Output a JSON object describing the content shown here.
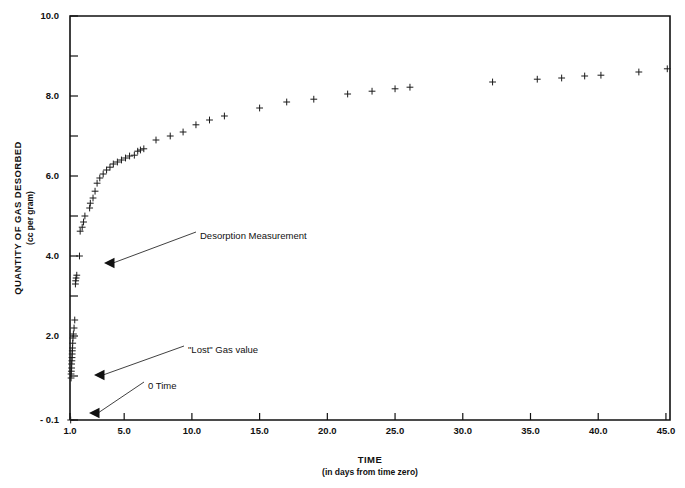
{
  "chart_data": {
    "type": "scatter",
    "title": "",
    "xlabel": "TIME",
    "xlabel_sub": "(in days from time zero)",
    "ylabel": "QUANTITY OF GAS DESORBED",
    "ylabel_sub": "(cc per gram)",
    "xlim": [
      1.0,
      45.3
    ],
    "ylim": [
      -0.1,
      10.0
    ],
    "grid": false,
    "legend": "none",
    "marker": "plus",
    "marker_color": "#1a1a1a",
    "xticks": [
      "1.0",
      "5.0",
      "10.0",
      "15.0",
      "20.0",
      "25.0",
      "30.0",
      "35.0",
      "40.0",
      "45.0"
    ],
    "xtick_values": [
      1.0,
      5.0,
      10.0,
      15.0,
      20.0,
      25.0,
      30.0,
      35.0,
      40.0,
      45.0
    ],
    "yticks": [
      "10.0",
      "8.0",
      "6.0",
      "4.0",
      "2.0",
      "- 0.1"
    ],
    "ytick_values": [
      10.0,
      8.0,
      6.0,
      4.0,
      2.0,
      -0.1
    ],
    "yminor_values": [
      9.0,
      7.0,
      5.0,
      3.0,
      1.0
    ],
    "series": [
      {
        "name": "Desorption data",
        "x": [
          1.05,
          1.08,
          1.08,
          1.1,
          1.12,
          1.12,
          1.14,
          1.15,
          1.16,
          1.17,
          1.18,
          1.2,
          1.22,
          1.25,
          1.3,
          1.35,
          1.4,
          1.42,
          1.45,
          1.5,
          1.7,
          1.75,
          1.9,
          2.0,
          2.1,
          2.45,
          2.5,
          2.7,
          2.85,
          3.0,
          3.2,
          3.45,
          3.7,
          3.95,
          4.2,
          4.5,
          4.8,
          5.1,
          5.4,
          5.75,
          6.0,
          6.2,
          6.45,
          7.35,
          8.4,
          9.35,
          10.3,
          11.3,
          12.4,
          15.0,
          17.0,
          19.0,
          21.5,
          23.3,
          25.0,
          26.1,
          32.2,
          35.5,
          37.3,
          39.0,
          40.2,
          43.0,
          45.1
        ],
        "y": [
          -0.1,
          0.95,
          1.05,
          1.12,
          1.2,
          1.3,
          1.38,
          1.46,
          1.55,
          1.63,
          1.7,
          1.82,
          1.95,
          2.05,
          2.2,
          2.4,
          3.3,
          3.38,
          3.45,
          3.52,
          4.0,
          4.62,
          4.72,
          4.85,
          5.0,
          5.2,
          5.32,
          5.45,
          5.62,
          5.82,
          5.95,
          6.05,
          6.15,
          6.22,
          6.3,
          6.35,
          6.4,
          6.45,
          6.5,
          6.52,
          6.62,
          6.65,
          6.68,
          6.9,
          7.0,
          7.1,
          7.28,
          7.4,
          7.5,
          7.7,
          7.85,
          7.92,
          8.05,
          8.12,
          8.18,
          8.22,
          8.35,
          8.42,
          8.45,
          8.5,
          8.52,
          8.6,
          8.68
        ]
      }
    ],
    "annotations": [
      {
        "label": "Desorption Measurement",
        "text_x": 200,
        "text_y": 236,
        "leader_from_x": 196,
        "leader_from_y": 232,
        "target_x": 104,
        "target_y": 263
      },
      {
        "label": "\"Lost\" Gas value",
        "text_x": 188,
        "text_y": 350,
        "leader_from_x": 184,
        "leader_from_y": 346,
        "target_x": 94,
        "target_y": 375
      },
      {
        "label": "0 Time",
        "text_x": 148,
        "text_y": 386,
        "leader_from_x": 144,
        "leader_from_y": 382,
        "target_x": 89,
        "target_y": 413
      }
    ]
  }
}
